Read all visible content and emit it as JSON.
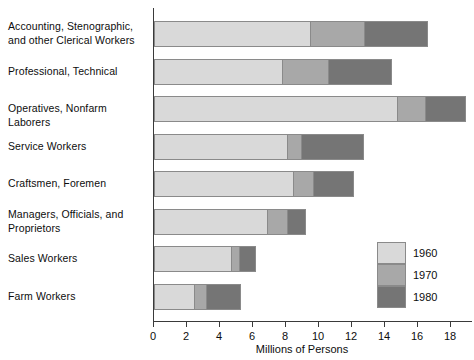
{
  "chart_data": {
    "type": "bar",
    "orientation": "horizontal",
    "stacked": false,
    "title": "",
    "xlabel": "Millions of Persons",
    "ylabel": "",
    "xlim": [
      0,
      19.4
    ],
    "xticks": [
      0,
      2,
      4,
      6,
      8,
      10,
      12,
      14,
      16,
      18
    ],
    "xtick_labels": [
      "0",
      "2",
      "4",
      "6",
      "8",
      "10",
      "12",
      "14",
      "16",
      "18"
    ],
    "grid": false,
    "legend_position": "inside-lower-right",
    "categories": [
      "Accounting, Stenographic, and other Clerical Workers",
      "Professional, Technical",
      "Operatives, Nonfarm Laborers",
      "Service Workers",
      "Craftsmen, Foremen",
      "Managers, Officials, and Proprietors",
      "Sales Workers",
      "Farm Workers"
    ],
    "series": [
      {
        "name": "1960",
        "color": "#d9d9d9",
        "values": [
          9.5,
          7.8,
          14.8,
          8.1,
          8.5,
          6.9,
          4.7,
          2.5
        ]
      },
      {
        "name": "1970",
        "color": "#a8a8a8",
        "values": [
          12.8,
          10.6,
          16.5,
          9.0,
          9.7,
          8.1,
          5.2,
          3.2
        ]
      },
      {
        "name": "1980",
        "color": "#757575",
        "values": [
          16.6,
          14.4,
          18.9,
          12.7,
          12.1,
          9.2,
          6.2,
          5.3
        ]
      }
    ]
  },
  "labels": {
    "cat_0_line1": "Accounting, Stenographic,",
    "cat_0_line2": "and other Clerical Workers",
    "cat_1_line1": "Professional, Technical",
    "cat_2_line1": "Operatives, Nonfarm Laborers",
    "cat_3_line1": "Service Workers",
    "cat_4_line1": "Craftsmen, Foremen",
    "cat_5_line1": "Managers, Officials, and",
    "cat_5_line2": "Proprietors",
    "cat_6_line1": "Sales Workers",
    "cat_7_line1": "Farm Workers"
  },
  "axis": {
    "title": "Millions of Persons",
    "ticks": [
      "0",
      "2",
      "4",
      "6",
      "8",
      "10",
      "12",
      "14",
      "16",
      "18"
    ]
  },
  "legend": {
    "items": [
      {
        "label": "1960",
        "color": "#d9d9d9"
      },
      {
        "label": "1970",
        "color": "#a8a8a8"
      },
      {
        "label": "1980",
        "color": "#757575"
      }
    ]
  }
}
